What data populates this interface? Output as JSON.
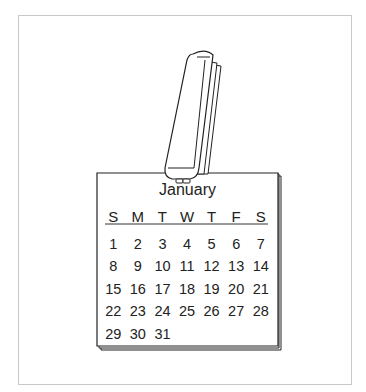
{
  "calendar": {
    "month": "January",
    "weekdays": [
      "S",
      "M",
      "T",
      "W",
      "T",
      "F",
      "S"
    ],
    "weeks": [
      [
        "1",
        "2",
        "3",
        "4",
        "5",
        "6",
        "7"
      ],
      [
        "8",
        "9",
        "10",
        "11",
        "12",
        "13",
        "14"
      ],
      [
        "15",
        "16",
        "17",
        "18",
        "19",
        "20",
        "21"
      ],
      [
        "22",
        "23",
        "24",
        "25",
        "26",
        "27",
        "28"
      ],
      [
        "29",
        "30",
        "31",
        "",
        "",
        "",
        ""
      ]
    ]
  },
  "illustration": {
    "clip_icon": "binder-clip-icon",
    "line_color": "#222222",
    "frame_color": "#c8c8c8"
  }
}
